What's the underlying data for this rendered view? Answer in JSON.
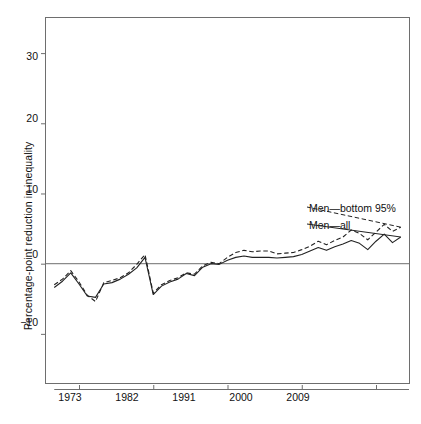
{
  "chart_data": {
    "type": "line",
    "title": "",
    "subtitle": "",
    "xlabel": "",
    "ylabel": "Percentage-point reduction in inequality",
    "xlim": [
      1969,
      2013
    ],
    "ylim": [
      -17,
      35
    ],
    "grid": false,
    "zero_line": true,
    "legend_position": "inside-right",
    "x_ticks": [
      1973,
      1982,
      1991,
      2000,
      2009
    ],
    "x_tick_labels": [
      "1973",
      "1982",
      "1991",
      "2000",
      "2009"
    ],
    "y_ticks": [
      -10,
      0,
      10,
      20,
      30
    ],
    "y_tick_labels": [
      "−10",
      "0",
      "10",
      "20",
      "30"
    ],
    "x": [
      1970,
      1971,
      1972,
      1973,
      1974,
      1975,
      1976,
      1977,
      1978,
      1979,
      1980,
      1981,
      1982,
      1983,
      1984,
      1985,
      1986,
      1987,
      1988,
      1989,
      1990,
      1991,
      1992,
      1993,
      1994,
      1995,
      1996,
      1997,
      1998,
      1999,
      2000,
      2001,
      2002,
      2003,
      2004,
      2005,
      2006,
      2007,
      2008,
      2009,
      2010,
      2011,
      2012
    ],
    "series": [
      {
        "name": "Men—bottom 95%",
        "style": "dashed",
        "color": "#222222",
        "values": [
          -3.0,
          -2.2,
          -1.0,
          -2.6,
          -4.5,
          -5.4,
          -2.7,
          -2.4,
          -2.0,
          -1.3,
          -0.1,
          1.3,
          -4.2,
          -3.0,
          -2.4,
          -2.0,
          -1.3,
          -1.5,
          -0.3,
          0.2,
          0.0,
          0.9,
          1.6,
          1.9,
          1.7,
          1.8,
          1.8,
          1.4,
          1.5,
          1.6,
          2.0,
          2.5,
          3.2,
          2.7,
          3.3,
          3.8,
          4.8,
          4.3,
          3.4,
          4.5,
          5.6,
          4.6,
          5.2
        ]
      },
      {
        "name": "Men—all",
        "style": "solid",
        "color": "#222222",
        "values": [
          -3.4,
          -2.5,
          -1.3,
          -2.9,
          -4.6,
          -4.8,
          -2.9,
          -2.7,
          -2.2,
          -1.5,
          -0.6,
          0.9,
          -4.4,
          -3.2,
          -2.6,
          -2.2,
          -1.4,
          -1.7,
          -0.5,
          0.0,
          -0.1,
          0.5,
          0.9,
          1.1,
          0.9,
          0.9,
          0.9,
          0.8,
          0.9,
          1.0,
          1.3,
          1.8,
          2.3,
          1.9,
          2.4,
          2.8,
          3.3,
          2.9,
          2.0,
          3.2,
          4.2,
          3.0,
          3.8
        ]
      }
    ],
    "annotations": [
      {
        "text": "Men—bottom 95%",
        "x": 2013.5,
        "y": 5.6
      },
      {
        "text": "Men—all",
        "x": 2013.5,
        "y": 4.0
      }
    ]
  },
  "axes": {
    "frame_color": "#6e6e6e",
    "zero_line_color": "#8a8a8a",
    "tick_color": "#6e6e6e"
  },
  "legend": {
    "items": [
      {
        "label": "Men—bottom 95%"
      },
      {
        "label": "Men—all"
      }
    ]
  }
}
